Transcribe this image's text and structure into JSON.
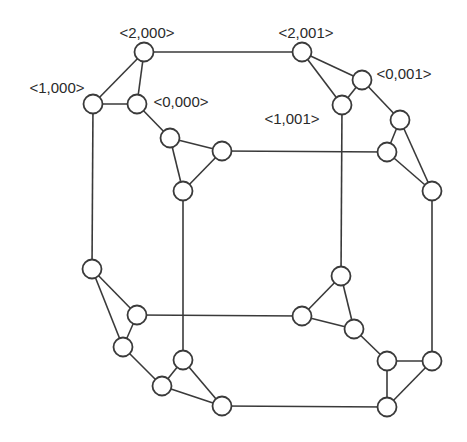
{
  "diagram": {
    "type": "graph",
    "colors": {
      "stroke": "#3a3a3a",
      "node_fill": "#ffffff",
      "label": "#2a2a2a",
      "background": "#ffffff"
    },
    "node_radius": 9.5,
    "nodes": [
      {
        "id": "n2000",
        "x": 144,
        "y": 52,
        "label": "<2,000>",
        "lx": 147,
        "ly": 38
      },
      {
        "id": "n1000",
        "x": 93,
        "y": 104,
        "label": "<1,000>",
        "lx": 57,
        "ly": 92
      },
      {
        "id": "n0000",
        "x": 137,
        "y": 104,
        "label": "<0,000>",
        "lx": 181,
        "ly": 106
      },
      {
        "id": "nA",
        "x": 170,
        "y": 138
      },
      {
        "id": "nB",
        "x": 222,
        "y": 151
      },
      {
        "id": "nC",
        "x": 183,
        "y": 191
      },
      {
        "id": "n2001",
        "x": 302,
        "y": 52,
        "label": "<2,001>",
        "lx": 306,
        "ly": 38
      },
      {
        "id": "n0001",
        "x": 362,
        "y": 80,
        "label": "<0,001>",
        "lx": 404,
        "ly": 78
      },
      {
        "id": "n1001",
        "x": 342,
        "y": 105,
        "label": "<1,001>",
        "lx": 292,
        "ly": 123
      },
      {
        "id": "nD",
        "x": 400,
        "y": 120
      },
      {
        "id": "nE",
        "x": 387,
        "y": 152
      },
      {
        "id": "nF",
        "x": 432,
        "y": 191
      },
      {
        "id": "nG",
        "x": 92,
        "y": 269
      },
      {
        "id": "nH",
        "x": 137,
        "y": 315
      },
      {
        "id": "nI",
        "x": 123,
        "y": 347
      },
      {
        "id": "nJ",
        "x": 183,
        "y": 360
      },
      {
        "id": "nK",
        "x": 162,
        "y": 386
      },
      {
        "id": "nL",
        "x": 222,
        "y": 406
      },
      {
        "id": "nM",
        "x": 341,
        "y": 276
      },
      {
        "id": "nN",
        "x": 302,
        "y": 316
      },
      {
        "id": "nO",
        "x": 354,
        "y": 329
      },
      {
        "id": "nP",
        "x": 387,
        "y": 361
      },
      {
        "id": "nQ",
        "x": 432,
        "y": 361
      },
      {
        "id": "nR",
        "x": 387,
        "y": 407
      }
    ],
    "edges": [
      [
        "n2000",
        "n1000"
      ],
      [
        "n2000",
        "n0000"
      ],
      [
        "n1000",
        "n0000"
      ],
      [
        "n2000",
        "n2001"
      ],
      [
        "n0000",
        "nA"
      ],
      [
        "nA",
        "nB"
      ],
      [
        "nA",
        "nC"
      ],
      [
        "nB",
        "nC"
      ],
      [
        "n1000",
        "nG"
      ],
      [
        "nC",
        "nJ"
      ],
      [
        "nB",
        "nE"
      ],
      [
        "n2001",
        "n0001"
      ],
      [
        "n2001",
        "n1001"
      ],
      [
        "n0001",
        "n1001"
      ],
      [
        "n0001",
        "nD"
      ],
      [
        "nD",
        "nE"
      ],
      [
        "nD",
        "nF"
      ],
      [
        "nE",
        "nF"
      ],
      [
        "n1001",
        "nM"
      ],
      [
        "nF",
        "nQ"
      ],
      [
        "nG",
        "nH"
      ],
      [
        "nG",
        "nI"
      ],
      [
        "nH",
        "nI"
      ],
      [
        "nH",
        "nN"
      ],
      [
        "nI",
        "nK"
      ],
      [
        "nJ",
        "nK"
      ],
      [
        "nJ",
        "nL"
      ],
      [
        "nK",
        "nL"
      ],
      [
        "nL",
        "nR"
      ],
      [
        "nM",
        "nN"
      ],
      [
        "nM",
        "nO"
      ],
      [
        "nN",
        "nO"
      ],
      [
        "nO",
        "nP"
      ],
      [
        "nP",
        "nQ"
      ],
      [
        "nP",
        "nR"
      ],
      [
        "nQ",
        "nR"
      ]
    ]
  },
  "labels": {
    "n2000": "<2,000>",
    "n1000": "<1,000>",
    "n0000": "<0,000>",
    "n2001": "<2,001>",
    "n0001": "<0,001>",
    "n1001": "<1,001>"
  }
}
